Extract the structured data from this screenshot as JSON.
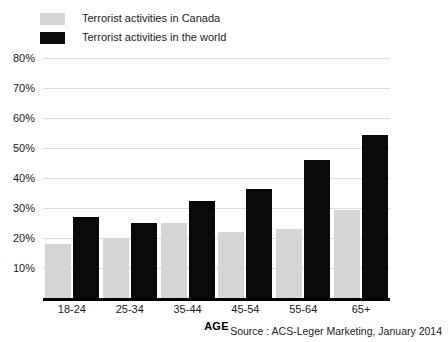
{
  "legend": {
    "items": [
      {
        "label": "Terrorist activities in Canada",
        "swatch": "canada",
        "color": "#d5d5d5"
      },
      {
        "label": "Terrorist activities in the world",
        "swatch": "world",
        "color": "#0a0a0a"
      }
    ]
  },
  "axis": {
    "x_title": "AGE",
    "y_ticks": [
      "80%",
      "70%",
      "60%",
      "50%",
      "40%",
      "30%",
      "20%",
      "10%"
    ]
  },
  "source": "Source : ACS-Leger Marketing, January 2014",
  "chart_data": {
    "type": "bar",
    "title": "",
    "subtitle": "",
    "xlabel": "AGE",
    "ylabel": "",
    "ylim": [
      0,
      80
    ],
    "ytick_values": [
      10,
      20,
      30,
      40,
      50,
      60,
      70,
      80
    ],
    "ytick_labels": [
      "10%",
      "20%",
      "30%",
      "40%",
      "50%",
      "60%",
      "70%",
      "80%"
    ],
    "grid": true,
    "legend_position": "top-left",
    "categories": [
      "18-24",
      "25-34",
      "35-44",
      "45-54",
      "55-64",
      "65+"
    ],
    "series": [
      {
        "name": "Terrorist activities in Canada",
        "color": "#d5d5d5",
        "values": [
          18,
          20,
          25,
          22,
          23,
          29.5
        ]
      },
      {
        "name": "Terrorist activities in the world",
        "color": "#0a0a0a",
        "values": [
          27,
          25,
          32.5,
          36.5,
          46,
          54.5
        ]
      }
    ],
    "annotations": [
      "Source : ACS-Leger Marketing, January 2014"
    ]
  }
}
